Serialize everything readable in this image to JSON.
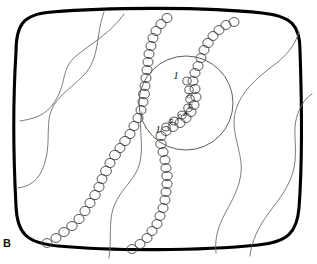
{
  "figure": {
    "panel_letter": "B",
    "background_color": "#ffffff",
    "border_color": "#000000",
    "contour_color": "#6d6d6d",
    "bead_color": "#3a3a3a",
    "inset_circle_color": "#555555",
    "label_color": "#1a1a1a",
    "width": 317,
    "height": 264
  },
  "inset": {
    "name": "magnified-region-circle",
    "center_x": 186,
    "center_y": 103,
    "radius": 47
  },
  "bead_labels": [
    {
      "id": "label-1-upper",
      "text": "1",
      "x": 176,
      "y": 79,
      "size": 11,
      "rotate": 0,
      "style": "italic"
    },
    {
      "id": "label-2",
      "text": "2",
      "x": 189,
      "y": 93,
      "size": 8,
      "rotate": 188,
      "style": "normal"
    },
    {
      "id": "label-3",
      "text": "3",
      "x": 191,
      "y": 104,
      "size": 8,
      "rotate": 200,
      "style": "normal"
    },
    {
      "id": "label-4",
      "text": "4",
      "x": 187,
      "y": 112,
      "size": 8,
      "rotate": 215,
      "style": "normal"
    },
    {
      "id": "label-5",
      "text": "5",
      "x": 181,
      "y": 115,
      "size": 8,
      "rotate": 230,
      "style": "normal"
    },
    {
      "id": "label-6",
      "text": "6",
      "x": 173,
      "y": 120,
      "size": 8,
      "rotate": 245,
      "style": "normal"
    },
    {
      "id": "label-1-lower",
      "text": "1",
      "x": 158,
      "y": 133,
      "size": 11,
      "rotate": 0,
      "style": "italic"
    }
  ],
  "chart_data": {
    "type": "diagram",
    "title": "",
    "elements": {
      "boundary": "rounded rectangle with convex bulging edges",
      "contour_lines": 5,
      "bead_chains": 3,
      "inset_circles": 1,
      "numbered_beads": 7
    }
  }
}
